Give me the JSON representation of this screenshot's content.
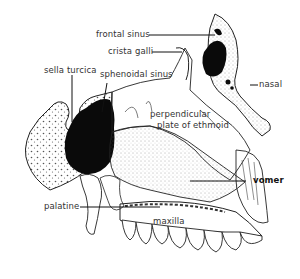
{
  "diagram": {
    "labels": {
      "frontal_sinus": "frontal sinus",
      "crista_galli": "crista galli",
      "sella_turcica": "sella turcica",
      "sphenoidal_sinus": "sphenoidal sinus",
      "nasal": "nasal",
      "perpendicular_plate_line1": "perpendicular",
      "perpendicular_plate_line2": "plate of ethmoid",
      "vomer": "vomer",
      "palatine": "palatine",
      "maxilla": "maxilla"
    }
  }
}
